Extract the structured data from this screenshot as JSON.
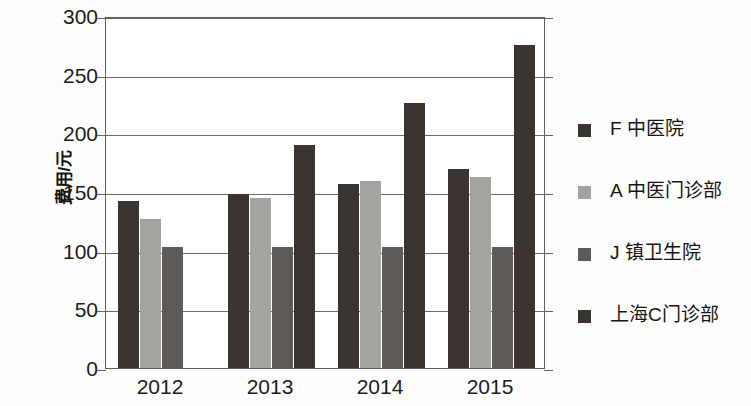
{
  "chart_data": {
    "type": "bar",
    "title": "",
    "xlabel": "",
    "ylabel": "费用/元",
    "categories": [
      "2012",
      "2013",
      "2014",
      "2015"
    ],
    "ylim": [
      0,
      300
    ],
    "yticks": [
      0,
      50,
      100,
      150,
      200,
      250,
      300
    ],
    "ytick_labels": [
      "0",
      "50",
      "100",
      "150",
      "200",
      "250",
      "300"
    ],
    "grid": true,
    "legend_position": "right",
    "series": [
      {
        "name": "F 中医院",
        "color": "#3b3431",
        "values": [
          142,
          148,
          157,
          170
        ]
      },
      {
        "name": "A 中医门诊部",
        "color": "#a3a3a0",
        "values": [
          127,
          145,
          159,
          163
        ]
      },
      {
        "name": "J 镇卫生院",
        "color": "#5d5a57",
        "values": [
          103,
          103,
          103,
          103
        ]
      },
      {
        "name": "上海C门诊部",
        "color": "#3a3330",
        "values": [
          null,
          190,
          226,
          275
        ]
      }
    ]
  },
  "axis": {
    "y_title": "费用/元",
    "y_tick_labels": [
      "300",
      "250",
      "200",
      "150",
      "100",
      "50",
      "0"
    ],
    "x_tick_labels": [
      "2012",
      "2013",
      "2014",
      "2015"
    ]
  },
  "legend": {
    "items": [
      {
        "label": "F 中医院",
        "color": "#3b3431"
      },
      {
        "label": "A 中医门诊部",
        "color": "#a3a3a0"
      },
      {
        "label": "J 镇卫生院",
        "color": "#5d5a57"
      },
      {
        "label": "上海C门诊部",
        "color": "#3a3330"
      }
    ]
  }
}
